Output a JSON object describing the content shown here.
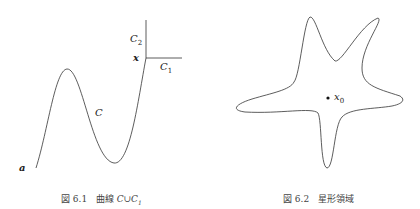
{
  "figure_left": {
    "caption_number": "図 6.1",
    "caption_text": "曲線",
    "caption_math": "C∪C",
    "caption_math_sub": "1",
    "labels": {
      "a": "a",
      "x": "x",
      "C": "C",
      "C1": "C",
      "C1_sub": "1",
      "C2": "C",
      "C2_sub": "2"
    }
  },
  "figure_right": {
    "caption_number": "図 6.2",
    "caption_text": "星形領域",
    "labels": {
      "x0": "x",
      "x0_sub": "0"
    }
  },
  "colors": {
    "line": "#333333",
    "text": "#222222",
    "caption": "#444444"
  }
}
